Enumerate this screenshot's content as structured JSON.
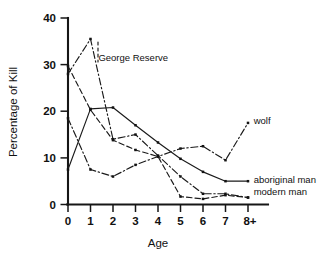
{
  "chart_data": {
    "type": "line",
    "title": "",
    "xlabel": "Age",
    "ylabel": "Percentage of Kill",
    "categories": [
      "0",
      "1",
      "2",
      "3",
      "4",
      "5",
      "6",
      "7",
      "8+"
    ],
    "x": [
      0,
      1,
      2,
      3,
      4,
      5,
      6,
      7,
      8
    ],
    "xlim": [
      0,
      8
    ],
    "ylim": [
      0,
      40
    ],
    "yticks": [
      0,
      10,
      20,
      30,
      40
    ],
    "grid": false,
    "legend_position": "inline-annotations",
    "series": [
      {
        "name": "George Reserve",
        "style": "dash-dot",
        "values": [
          28.0,
          35.5,
          14.0,
          15.0,
          10.5,
          6.0,
          2.3,
          2.3,
          1.5
        ]
      },
      {
        "name": "wolf",
        "style": "dash-dot",
        "values": [
          18.5,
          7.5,
          6.0,
          8.5,
          10.3,
          12.0,
          12.5,
          9.5,
          17.5
        ]
      },
      {
        "name": "aboriginal man",
        "style": "solid",
        "values": [
          7.5,
          20.5,
          20.8,
          17.0,
          13.3,
          9.8,
          7.0,
          5.0,
          5.0
        ]
      },
      {
        "name": "modern man",
        "style": "dashed",
        "values": [
          29.7,
          20.3,
          13.8,
          11.7,
          10.3,
          1.7,
          1.2,
          2.0,
          1.5
        ]
      }
    ],
    "annotations": [
      {
        "text": "George Reserve",
        "x": 1.35,
        "y": 31.5
      },
      {
        "text": "wolf",
        "x": 8.25,
        "y": 18.0
      },
      {
        "text": "aboriginal man",
        "x": 8.25,
        "y": 5.3
      },
      {
        "text": "modern man",
        "x": 8.25,
        "y": 2.6
      }
    ],
    "colors": {
      "ink": "#161616",
      "background": "#ffffff"
    }
  }
}
